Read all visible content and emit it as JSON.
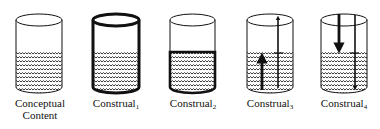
{
  "figure": {
    "items": [
      {
        "id": "conceptual-content",
        "label_line1": "Conceptual",
        "label_line2": "Content",
        "subscript": "",
        "variant": "plain"
      },
      {
        "id": "construal-1",
        "label_line1": "Construal",
        "label_line2": "",
        "subscript": "1",
        "variant": "bold-outline"
      },
      {
        "id": "construal-2",
        "label_line1": "Construal",
        "label_line2": "",
        "subscript": "2",
        "variant": "bold-contents"
      },
      {
        "id": "construal-3",
        "label_line1": "Construal",
        "label_line2": "",
        "subscript": "3",
        "variant": "arrows-up"
      },
      {
        "id": "construal-4",
        "label_line1": "Construal",
        "label_line2": "",
        "subscript": "4",
        "variant": "arrows-down"
      }
    ],
    "colors": {
      "ink": "#111111",
      "background": "#ffffff"
    }
  }
}
